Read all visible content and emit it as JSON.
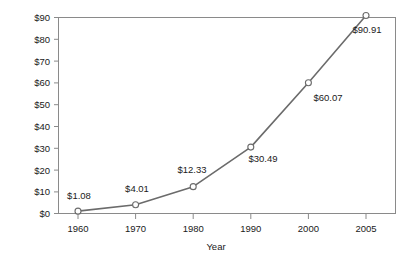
{
  "chart_data": {
    "type": "line",
    "title": "",
    "xlabel": "Year",
    "ylabel": "",
    "categories": [
      "1960",
      "1970",
      "1980",
      "1990",
      "2000",
      "2005"
    ],
    "x": [
      1960,
      1970,
      1980,
      1990,
      2000,
      2005
    ],
    "values": [
      1.08,
      4.01,
      12.33,
      30.49,
      60.07,
      90.91
    ],
    "point_labels": [
      "$1.08",
      "$4.01",
      "$12.33",
      "$30.49",
      "$60.07",
      "$90.91"
    ],
    "ylim": [
      0,
      90
    ],
    "xlim": [
      1960,
      2005
    ],
    "y_ticks": [
      0,
      10,
      20,
      30,
      40,
      50,
      60,
      70,
      80,
      90
    ],
    "y_tick_labels": [
      "$0",
      "$10",
      "$20",
      "$30",
      "$40",
      "$50",
      "$60",
      "$70",
      "$80",
      "$90"
    ],
    "x_tick_labels": [
      "1960",
      "1970",
      "1980",
      "1990",
      "2000",
      "2005"
    ],
    "grid": false,
    "legend": false,
    "legend_position": "none",
    "series": [
      {
        "name": "",
        "values": [
          1.08,
          4.01,
          12.33,
          30.49,
          60.07,
          90.91
        ]
      }
    ],
    "colors": {
      "line": "#6b6b6b",
      "marker_fill": "#ffffff",
      "marker_stroke": "#6b6b6b",
      "axis": "#8a8a8a",
      "text": "#1a1a1a",
      "background": "#ffffff"
    }
  }
}
